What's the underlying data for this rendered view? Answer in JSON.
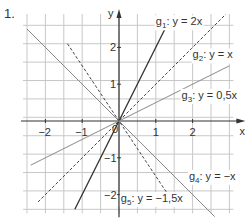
{
  "exercise_number": "1.",
  "chart_data": {
    "type": "line",
    "title": "",
    "xlabel": "x",
    "ylabel": "y",
    "xlim": [
      -2.5,
      3.0
    ],
    "ylim": [
      -2.4,
      2.8
    ],
    "grid": true,
    "grid_step": 0.5,
    "x_ticks": [
      -2,
      -1,
      1,
      2
    ],
    "y_ticks": [
      -2,
      -1,
      1,
      2
    ],
    "origin_label": "0",
    "series": [
      {
        "name": "g1",
        "label_sub": "1",
        "label": "g1: y = 2x",
        "slope": 2,
        "x_range": [
          -1.2,
          1.3
        ],
        "style": "solid",
        "color": "#333333",
        "width": 1.3,
        "label_pos": [
          1.0,
          2.6
        ]
      },
      {
        "name": "g2",
        "label_sub": "2",
        "label": "g2: y = x",
        "slope": 1,
        "x_range": [
          -2.2,
          2.9
        ],
        "style": "dashed",
        "color": "#444444",
        "width": 1.0,
        "label_pos": [
          2.0,
          1.7
        ]
      },
      {
        "name": "g3",
        "label_sub": "3",
        "label": "g3: y = 0,5x",
        "slope": 0.5,
        "x_range": [
          -2.4,
          3.0
        ],
        "style": "solid",
        "color": "#8a8a8a",
        "width": 1.0,
        "label_pos": [
          1.7,
          0.6
        ]
      },
      {
        "name": "g4",
        "label_sub": "4",
        "label": "g4: y = −x",
        "slope": -1,
        "x_range": [
          -2.5,
          2.6
        ],
        "style": "solid",
        "color": "#8a8a8a",
        "width": 1.0,
        "label_pos": [
          1.9,
          -1.6
        ]
      },
      {
        "name": "g5",
        "label_sub": "5",
        "label": "g5: y = −1,5x",
        "slope": -1.5,
        "x_range": [
          -1.4,
          1.5
        ],
        "style": "dashed",
        "color": "#444444",
        "width": 1.0,
        "label_pos": [
          0.05,
          -2.2
        ]
      }
    ],
    "labels": {
      "g1": {
        "name": "g",
        "sub": "1",
        "eq": ": y = 2x"
      },
      "g2": {
        "name": "g",
        "sub": "2",
        "eq": ": y = x"
      },
      "g3": {
        "name": "g",
        "sub": "3",
        "eq": ": y = 0,5x"
      },
      "g4": {
        "name": "g",
        "sub": "4",
        "eq": ": y = −x"
      },
      "g5": {
        "name": "g",
        "sub": "5",
        "eq": ": y = −1,5x"
      }
    }
  },
  "colors": {
    "grid": "#c8c8c8",
    "axis": "#333333",
    "text": "#333333"
  }
}
